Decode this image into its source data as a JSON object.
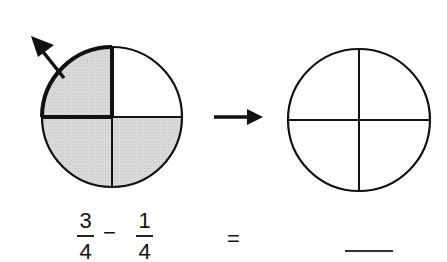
{
  "diagram": {
    "left_circle": {
      "parts": 4,
      "shaded_parts": 3,
      "removed_part": "top-left",
      "shade_color": "#d6d6d6",
      "stroke_color": "#111111"
    },
    "transition_arrow": "arrow-right",
    "right_circle": {
      "parts": 4,
      "shaded_parts": 0,
      "stroke_color": "#111111"
    }
  },
  "equation": {
    "term1": {
      "numerator": "3",
      "denominator": "4"
    },
    "operator": "−",
    "term2": {
      "numerator": "1",
      "denominator": "4"
    },
    "equals": "=",
    "answer_blank": ""
  }
}
